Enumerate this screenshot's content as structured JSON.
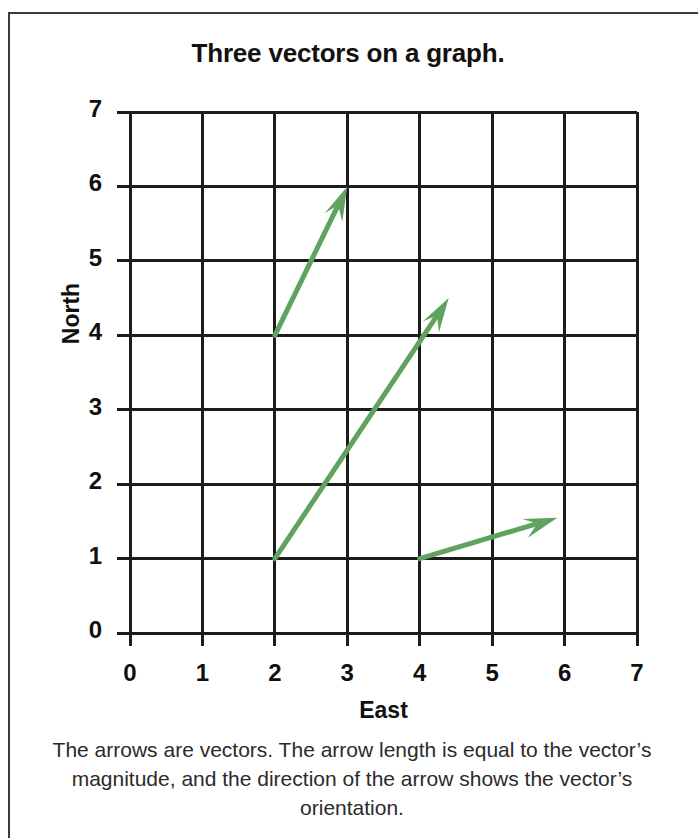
{
  "figure": {
    "title": "Three vectors on a graph.",
    "caption": "The arrows are vectors. The arrow length is equal to the vector’s magnitude, and the direction of the arrow shows the vector’s orientation.",
    "border_color": "#3a3a3c",
    "background": "#ffffff"
  },
  "chart_data": {
    "type": "scatter",
    "title": "Three vectors on a graph.",
    "xlabel": "East",
    "ylabel": "North",
    "xlim": [
      0,
      7
    ],
    "ylim": [
      0,
      7
    ],
    "xticks": [
      "0",
      "1",
      "2",
      "3",
      "4",
      "5",
      "6",
      "7"
    ],
    "yticks": [
      "0",
      "1",
      "2",
      "3",
      "4",
      "5",
      "6",
      "7"
    ],
    "xtick_values": [
      0,
      1,
      2,
      3,
      4,
      5,
      6,
      7
    ],
    "ytick_values": [
      0,
      1,
      2,
      3,
      4,
      5,
      6,
      7
    ],
    "grid": true,
    "grid_color": "#1c1c1c",
    "legend": "none",
    "vector_color": "#5fa35f",
    "vectors": [
      {
        "name": "vector-1",
        "tail": [
          2,
          4
        ],
        "tip": [
          3,
          6
        ],
        "dx": 1,
        "dy": 2
      },
      {
        "name": "vector-2",
        "tail": [
          2,
          1
        ],
        "tip": [
          4.4,
          4.5
        ],
        "dx": 2.4,
        "dy": 3.5
      },
      {
        "name": "vector-3",
        "tail": [
          4,
          1
        ],
        "tip": [
          5.9,
          1.55
        ],
        "dx": 1.9,
        "dy": 0.55
      }
    ],
    "annotations": [
      "The arrows are vectors. The arrow length is equal to the vector’s magnitude, and the direction of the arrow shows the vector’s orientation."
    ]
  }
}
